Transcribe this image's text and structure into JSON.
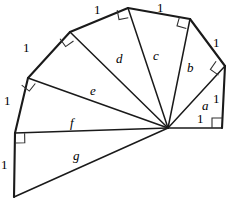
{
  "figure": {
    "type": "geometric-diagram",
    "width": 231,
    "height": 203,
    "background_color": "#ffffff",
    "stroke_color": "#1a1a1a",
    "center_point": {
      "x": 168,
      "y": 128
    }
  },
  "hypotenuse_labels": [
    {
      "id": "a",
      "text": "a",
      "x": 202,
      "y": 99
    },
    {
      "id": "b",
      "text": "b",
      "x": 187,
      "y": 61
    },
    {
      "id": "c",
      "text": "c",
      "x": 153,
      "y": 49
    },
    {
      "id": "d",
      "text": "d",
      "x": 116,
      "y": 52
    },
    {
      "id": "e",
      "text": "e",
      "x": 90,
      "y": 84
    },
    {
      "id": "f",
      "text": "f",
      "x": 70,
      "y": 116
    },
    {
      "id": "g",
      "text": "g",
      "x": 73,
      "y": 149
    }
  ],
  "unit_labels": [
    {
      "id": "unit-base",
      "text": "1",
      "x": 197,
      "y": 112
    },
    {
      "id": "unit-right",
      "text": "1",
      "x": 213,
      "y": 92
    },
    {
      "id": "unit-upper-right",
      "text": "1",
      "x": 213,
      "y": 36
    },
    {
      "id": "unit-top-right",
      "text": "1",
      "x": 157,
      "y": 1
    },
    {
      "id": "unit-top-left",
      "text": "1",
      "x": 94,
      "y": 3
    },
    {
      "id": "unit-left-upper",
      "text": "1",
      "x": 23,
      "y": 41
    },
    {
      "id": "unit-left-lower",
      "text": "1",
      "x": 4,
      "y": 94
    },
    {
      "id": "unit-bottom-left",
      "text": "1",
      "x": 1,
      "y": 158
    }
  ],
  "vertices": [
    {
      "id": "v0",
      "name": "base-right-vertex",
      "x": 222,
      "y": 128
    },
    {
      "id": "v1",
      "name": "vertex-a",
      "x": 225,
      "y": 66
    },
    {
      "id": "v2",
      "name": "vertex-b",
      "x": 190,
      "y": 19
    },
    {
      "id": "v3",
      "name": "vertex-c",
      "x": 128,
      "y": 8
    },
    {
      "id": "v4",
      "name": "vertex-d",
      "x": 70,
      "y": 32
    },
    {
      "id": "v5",
      "name": "vertex-e",
      "x": 28,
      "y": 78
    },
    {
      "id": "v6",
      "name": "vertex-f",
      "x": 15,
      "y": 133
    },
    {
      "id": "v7",
      "name": "vertex-g",
      "x": 14,
      "y": 197
    }
  ],
  "spokes": [
    {
      "id": "spoke-base",
      "label": null,
      "from": "center",
      "to": "v0"
    },
    {
      "id": "spoke-a",
      "label": "a",
      "from": "center",
      "to": "v1"
    },
    {
      "id": "spoke-b",
      "label": "b",
      "from": "center",
      "to": "v2"
    },
    {
      "id": "spoke-c",
      "label": "c",
      "from": "center",
      "to": "v3"
    },
    {
      "id": "spoke-d",
      "label": "d",
      "from": "center",
      "to": "v4"
    },
    {
      "id": "spoke-e",
      "label": "e",
      "from": "center",
      "to": "v5"
    },
    {
      "id": "spoke-f",
      "label": "f",
      "from": "center",
      "to": "v6"
    },
    {
      "id": "spoke-g",
      "label": "g",
      "from": "center",
      "to": "v7"
    }
  ],
  "outer_edges": [
    {
      "id": "edge-1",
      "from": "v0",
      "to": "v1",
      "length_label": "1"
    },
    {
      "id": "edge-2",
      "from": "v1",
      "to": "v2",
      "length_label": "1"
    },
    {
      "id": "edge-3",
      "from": "v2",
      "to": "v3",
      "length_label": "1"
    },
    {
      "id": "edge-4",
      "from": "v3",
      "to": "v4",
      "length_label": "1"
    },
    {
      "id": "edge-5",
      "from": "v4",
      "to": "v5",
      "length_label": "1"
    },
    {
      "id": "edge-6",
      "from": "v5",
      "to": "v6",
      "length_label": "1"
    },
    {
      "id": "edge-7",
      "from": "v6",
      "to": "v7",
      "length_label": "1"
    }
  ],
  "right_angles": [
    {
      "id": "ra-0",
      "at": "v0"
    },
    {
      "id": "ra-1",
      "at": "v1"
    },
    {
      "id": "ra-2",
      "at": "v2"
    },
    {
      "id": "ra-3",
      "at": "v3"
    },
    {
      "id": "ra-4",
      "at": "v4"
    },
    {
      "id": "ra-5",
      "at": "v5"
    },
    {
      "id": "ra-6",
      "at": "v6"
    }
  ]
}
